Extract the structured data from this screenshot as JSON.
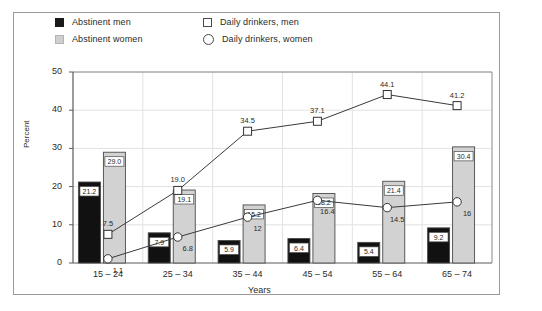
{
  "legend": {
    "items": [
      {
        "label": "Abstinent men",
        "marker": "filled-square-black",
        "color": "#1a1a1a"
      },
      {
        "label": "Abstinent women",
        "marker": "filled-square-gray",
        "color": "#cfcfcf"
      },
      {
        "label": "Daily drinkers, men",
        "marker": "open-square",
        "color": "#ffffff"
      },
      {
        "label": "Daily drinkers, women",
        "marker": "open-circle",
        "color": "#ffffff"
      }
    ]
  },
  "chart_data": {
    "type": "bar",
    "title": "",
    "xlabel": "Years",
    "ylabel": "Percent",
    "categories": [
      "15 – 24",
      "25 – 34",
      "35 – 44",
      "45 – 54",
      "55 – 64",
      "65 – 74"
    ],
    "ylim": [
      0,
      50
    ],
    "yticks": [
      0,
      10,
      20,
      30,
      40,
      50
    ],
    "grid": true,
    "legend_position": "top-left",
    "series": [
      {
        "name": "Abstinent men",
        "type": "bar",
        "marker": "filled-square-black",
        "values": [
          21.2,
          7.9,
          5.9,
          6.4,
          5.4,
          9.2
        ],
        "labels": [
          "21.2",
          "7.9",
          "5.9",
          "6.4",
          "5.4",
          "9.2"
        ]
      },
      {
        "name": "Abstinent women",
        "type": "bar",
        "marker": "filled-square-gray",
        "values": [
          29.0,
          19.1,
          15.2,
          18.2,
          21.4,
          30.4
        ],
        "labels": [
          "29.0",
          "19.1",
          "15.2",
          "18.2",
          "21.4",
          "30.4"
        ]
      },
      {
        "name": "Daily drinkers, men",
        "type": "line",
        "marker": "open-square",
        "values": [
          7.5,
          19.0,
          34.5,
          37.1,
          44.1,
          41.2
        ],
        "labels": [
          "7.5",
          "19.0",
          "34.5",
          "37.1",
          "44.1",
          "41.2"
        ]
      },
      {
        "name": "Daily drinkers, women",
        "type": "line",
        "marker": "open-circle",
        "values": [
          1.1,
          6.8,
          12,
          16.4,
          14.5,
          16
        ],
        "labels": [
          "1.1",
          "6.8",
          "12",
          "16.4",
          "14.5",
          "16"
        ]
      }
    ]
  }
}
